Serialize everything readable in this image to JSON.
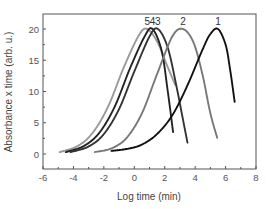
{
  "chart_data": {
    "type": "line",
    "title": "",
    "xlabel": "Log time (min)",
    "ylabel": "Absorbance x time (arb. u.)",
    "xlim": [
      -6,
      8
    ],
    "ylim": [
      -2.4,
      22.4
    ],
    "x_ticks": [
      -6,
      -4,
      -2,
      0,
      2,
      4,
      6,
      8
    ],
    "x_tick_labels": [
      "-6",
      "-4",
      "-2",
      "0",
      "2",
      "4",
      "6",
      "8"
    ],
    "y_ticks": [
      0,
      5,
      10,
      15,
      20
    ],
    "y_tick_labels": [
      "0",
      "5",
      "10",
      "15",
      "20"
    ],
    "grid": false,
    "legend": "none (curves labeled inline at peaks)",
    "series": [
      {
        "name": "1",
        "color": "#111111",
        "peak_x": 5.5,
        "peak_y": 20,
        "x_start": -1.5,
        "x_end": 6.6,
        "y_end": 8.3,
        "width": 1.9,
        "points": [
          [
            -1.5,
            0.5
          ],
          [
            -0.5,
            0.8
          ],
          [
            0.5,
            1.5
          ],
          [
            1.5,
            3.2
          ],
          [
            2.5,
            6.2
          ],
          [
            3.5,
            11
          ],
          [
            4.5,
            16.8
          ],
          [
            5.0,
            19.2
          ],
          [
            5.5,
            20
          ],
          [
            6.0,
            17.5
          ],
          [
            6.3,
            13.5
          ],
          [
            6.6,
            8.3
          ]
        ]
      },
      {
        "name": "2",
        "color": "#777777",
        "peak_x": 3.2,
        "peak_y": 20,
        "x_start": -2.6,
        "x_end": 5.45,
        "y_end": 2.6,
        "width": 1.9,
        "points": [
          [
            -2.6,
            0.3
          ],
          [
            -1.5,
            0.9
          ],
          [
            -0.5,
            2.6
          ],
          [
            0.5,
            6.5
          ],
          [
            1.5,
            12.8
          ],
          [
            2.5,
            18.8
          ],
          [
            3.2,
            20
          ],
          [
            3.9,
            17.8
          ],
          [
            4.5,
            12.5
          ],
          [
            5.0,
            6.5
          ],
          [
            5.45,
            2.6
          ]
        ]
      },
      {
        "name": "3",
        "color": "#333333",
        "peak_x": 1.55,
        "peak_y": 20,
        "x_start": -4.2,
        "x_end": 3.5,
        "y_end": 1.8,
        "width": 1.9,
        "points": [
          [
            -4.2,
            0.3
          ],
          [
            -3,
            1.2
          ],
          [
            -2,
            3.2
          ],
          [
            -1,
            7.2
          ],
          [
            0,
            13.2
          ],
          [
            1.0,
            18.8
          ],
          [
            1.55,
            20
          ],
          [
            2.2,
            17.0
          ],
          [
            2.8,
            10.5
          ],
          [
            3.2,
            5.5
          ],
          [
            3.5,
            1.8
          ]
        ]
      },
      {
        "name": "4",
        "color": "#222222",
        "peak_x": 1.2,
        "peak_y": 20,
        "x_start": -4.5,
        "x_end": 2.55,
        "y_end": 3.5,
        "width": 1.9,
        "points": [
          [
            -4.5,
            0.3
          ],
          [
            -3.3,
            1.3
          ],
          [
            -2.3,
            3.4
          ],
          [
            -1.3,
            7.5
          ],
          [
            -0.3,
            13.6
          ],
          [
            0.7,
            18.9
          ],
          [
            1.2,
            20
          ],
          [
            1.8,
            16.5
          ],
          [
            2.2,
            10.0
          ],
          [
            2.55,
            3.5
          ]
        ]
      },
      {
        "name": "5",
        "color": "#999999",
        "peak_x": 0.85,
        "peak_y": 20,
        "x_start": -4.9,
        "x_end": 2.7,
        "y_end": 11,
        "width": 1.9,
        "points": [
          [
            -4.9,
            0.3
          ],
          [
            -3.7,
            1.3
          ],
          [
            -2.7,
            3.5
          ],
          [
            -1.7,
            7.7
          ],
          [
            -0.7,
            13.8
          ],
          [
            0.3,
            19.0
          ],
          [
            0.85,
            20
          ],
          [
            1.5,
            18.0
          ],
          [
            2.1,
            14.5
          ],
          [
            2.7,
            11
          ]
        ]
      }
    ]
  }
}
